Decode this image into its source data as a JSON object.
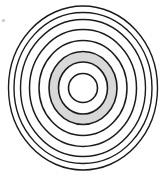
{
  "figure": {
    "background_color": "#ffffff",
    "stroke_color": "#1b1b1b",
    "highlight_fill_color": "#d8d8d8",
    "speck_color": "#cfcfcf",
    "center": {
      "x": 83,
      "y": 88
    },
    "ring_count": 8,
    "highlighted_band": {
      "label": "shaded band between ring 2 and ring 3",
      "inner_ring_index": 2,
      "outer_ring_index": 3
    }
  },
  "chart_data": {
    "type": "scatter",
    "xlabel": "",
    "ylabel": "",
    "grid": false,
    "legend": "none",
    "center_x": 83,
    "center_y": 88,
    "xlim": [
      0,
      165
    ],
    "ylim": [
      0,
      177
    ],
    "rings": [
      {
        "index": 1,
        "rx": 14.5,
        "ry": 14.5,
        "stroke_width": 1.6,
        "fill": "none"
      },
      {
        "index": 2,
        "rx": 24.5,
        "ry": 26.0,
        "stroke_width": 1.6,
        "fill": "none"
      },
      {
        "index": 3,
        "rx": 34.0,
        "ry": 36.5,
        "stroke_width": 1.6,
        "fill": "none"
      },
      {
        "index": 4,
        "rx": 44.0,
        "ry": 47.5,
        "stroke_width": 1.5,
        "fill": "none"
      },
      {
        "index": 5,
        "rx": 53.5,
        "ry": 58.5,
        "stroke_width": 1.5,
        "fill": "none"
      },
      {
        "index": 6,
        "rx": 62.5,
        "ry": 68.5,
        "stroke_width": 1.4,
        "fill": "none"
      },
      {
        "index": 7,
        "rx": 69.0,
        "ry": 75.5,
        "stroke_width": 1.4,
        "fill": "none"
      },
      {
        "index": 8,
        "rx": 74.5,
        "ry": 82.0,
        "stroke_width": 1.4,
        "fill": "none"
      }
    ],
    "filled_band": {
      "outer_rx": 34.0,
      "outer_ry": 36.5,
      "inner_rx": 24.5,
      "inner_ry": 26.0,
      "color": "#d8d8d8"
    },
    "artifacts": [
      {
        "name": "speck",
        "x": 3.5,
        "y": 20.5,
        "rx": 2.0,
        "ry": 1.6
      }
    ]
  }
}
